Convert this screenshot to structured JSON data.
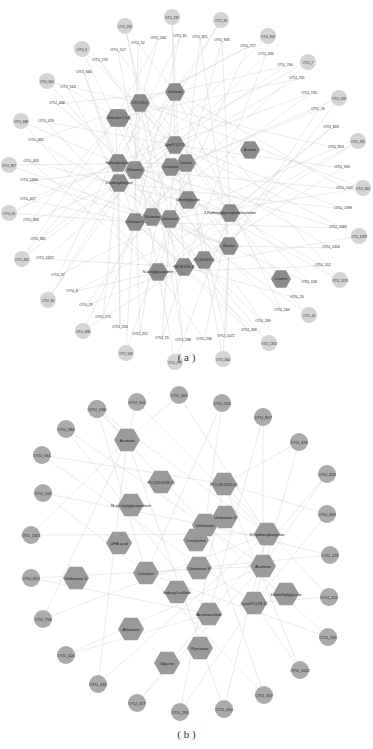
{
  "panel_a": {
    "caption": "( a )",
    "metabolites": [
      {
        "label": "Unknown",
        "x": 175,
        "y": 92
      },
      {
        "label": "LPC(18:0)",
        "x": 140,
        "y": 103
      },
      {
        "label": "PC(18:1/20:4)",
        "x": 120,
        "y": 118
      },
      {
        "label": "Unknown 2",
        "x": 116,
        "y": 118
      },
      {
        "label": "LysoPC(17:1)",
        "x": 175,
        "y": 145
      },
      {
        "label": "Acetone",
        "x": 250,
        "y": 150
      },
      {
        "label": "Hydroxybutyrate",
        "x": 118,
        "y": 163
      },
      {
        "label": "Glutamine",
        "x": 135,
        "y": 170
      },
      {
        "label": "Creatinine",
        "x": 171,
        "y": 167
      },
      {
        "label": "Leucine",
        "x": 186,
        "y": 163
      },
      {
        "label": "3-hydroxybutyrate",
        "x": 119,
        "y": 183
      },
      {
        "label": "Dimethylglycine",
        "x": 188,
        "y": 200
      },
      {
        "label": "1-Palmitoylglycerophosphocholine",
        "x": 230,
        "y": 213
      },
      {
        "label": "Unknown 3",
        "x": 135,
        "y": 222
      },
      {
        "label": "Glutamate",
        "x": 152,
        "y": 217
      },
      {
        "label": "Isoleucine",
        "x": 170,
        "y": 219
      },
      {
        "label": "Betaine",
        "x": 229,
        "y": 246
      },
      {
        "label": "PC(16:0/18:2)",
        "x": 204,
        "y": 260
      },
      {
        "label": "PE(18:0/20:4)",
        "x": 184,
        "y": 267
      },
      {
        "label": "N-acetylglycoprotein",
        "x": 158,
        "y": 272
      },
      {
        "label": "Creatine",
        "x": 281,
        "y": 279
      }
    ],
    "otus_circle": [
      {
        "label": "OTU_233",
        "x": 125,
        "y": 26
      },
      {
        "label": "OTU_237",
        "x": 172,
        "y": 17
      },
      {
        "label": "OTU_90",
        "x": 221,
        "y": 20
      },
      {
        "label": "OTU_903",
        "x": 268,
        "y": 36
      },
      {
        "label": "OTU_7",
        "x": 308,
        "y": 62
      },
      {
        "label": "OTU_539",
        "x": 339,
        "y": 98
      },
      {
        "label": "OTU_705",
        "x": 358,
        "y": 141
      },
      {
        "label": "OTU_360",
        "x": 363,
        "y": 188
      },
      {
        "label": "OTU_1199",
        "x": 359,
        "y": 236
      },
      {
        "label": "OTU_1373",
        "x": 340,
        "y": 280
      },
      {
        "label": "OTU_13",
        "x": 309,
        "y": 315
      },
      {
        "label": "OTU_1353",
        "x": 269,
        "y": 343
      },
      {
        "label": "OTU_306",
        "x": 223,
        "y": 359
      },
      {
        "label": "OTU_377",
        "x": 175,
        "y": 362
      },
      {
        "label": "OTU_549",
        "x": 126,
        "y": 353
      },
      {
        "label": "OTU_498",
        "x": 83,
        "y": 331
      },
      {
        "label": "OTU_30",
        "x": 48,
        "y": 300
      },
      {
        "label": "OTU_355",
        "x": 22,
        "y": 259
      },
      {
        "label": "OTU_50",
        "x": 9,
        "y": 213
      },
      {
        "label": "OTU_367",
        "x": 9,
        "y": 165
      },
      {
        "label": "OTU_448",
        "x": 21,
        "y": 121
      },
      {
        "label": "OTU_600",
        "x": 47,
        "y": 81
      },
      {
        "label": "OTU_6",
        "x": 82,
        "y": 49
      }
    ],
    "otus_text": [
      {
        "label": "OTU_52",
        "x": 138,
        "y": 44
      },
      {
        "label": "OTU_534",
        "x": 158,
        "y": 39
      },
      {
        "label": "OTU_81",
        "x": 180,
        "y": 37
      },
      {
        "label": "OTU_821",
        "x": 200,
        "y": 38
      },
      {
        "label": "OTU_835",
        "x": 222,
        "y": 41
      },
      {
        "label": "OTU_717",
        "x": 248,
        "y": 47
      },
      {
        "label": "OTU_436",
        "x": 266,
        "y": 55
      },
      {
        "label": "OTU_700",
        "x": 285,
        "y": 66
      },
      {
        "label": "OTU_741",
        "x": 297,
        "y": 79
      },
      {
        "label": "OTU_745",
        "x": 309,
        "y": 94
      },
      {
        "label": "OTU_76",
        "x": 318,
        "y": 110
      },
      {
        "label": "OTU_826",
        "x": 331,
        "y": 128
      },
      {
        "label": "OTU_813",
        "x": 336,
        "y": 148
      },
      {
        "label": "OTU_963",
        "x": 342,
        "y": 168
      },
      {
        "label": "OTU_1047",
        "x": 345,
        "y": 189
      },
      {
        "label": "OTU_1398",
        "x": 343,
        "y": 209
      },
      {
        "label": "OTU_1083",
        "x": 338,
        "y": 228
      },
      {
        "label": "OTU_1454",
        "x": 331,
        "y": 248
      },
      {
        "label": "OTU_152",
        "x": 323,
        "y": 266
      },
      {
        "label": "OTU_158",
        "x": 309,
        "y": 283
      },
      {
        "label": "OTU_20",
        "x": 297,
        "y": 298
      },
      {
        "label": "OTU_264",
        "x": 282,
        "y": 311
      },
      {
        "label": "OTU_289",
        "x": 263,
        "y": 322
      },
      {
        "label": "OTU_209",
        "x": 249,
        "y": 331
      },
      {
        "label": "OTU_1072",
        "x": 226,
        "y": 337
      },
      {
        "label": "OTU_236",
        "x": 204,
        "y": 340
      },
      {
        "label": "OTU_238",
        "x": 183,
        "y": 341
      },
      {
        "label": "OTU_25",
        "x": 162,
        "y": 339
      },
      {
        "label": "OTU_251",
        "x": 140,
        "y": 335
      },
      {
        "label": "OTU_256",
        "x": 120,
        "y": 328
      },
      {
        "label": "OTU_273",
        "x": 103,
        "y": 318
      },
      {
        "label": "OTU_29",
        "x": 86,
        "y": 306
      },
      {
        "label": "OTU_3",
        "x": 72,
        "y": 292
      },
      {
        "label": "OTU_37",
        "x": 58,
        "y": 276
      },
      {
        "label": "OTU_1321",
        "x": 45,
        "y": 259
      },
      {
        "label": "OTU_381",
        "x": 38,
        "y": 240
      },
      {
        "label": "OTU_393",
        "x": 31,
        "y": 221
      },
      {
        "label": "OTU_417",
        "x": 28,
        "y": 200
      },
      {
        "label": "OTU_1364",
        "x": 29,
        "y": 181
      },
      {
        "label": "OTU_453",
        "x": 31,
        "y": 162
      },
      {
        "label": "OTU_461",
        "x": 36,
        "y": 141
      },
      {
        "label": "OTU_476",
        "x": 46,
        "y": 122
      },
      {
        "label": "OTU_436b",
        "x": 57,
        "y": 104
      },
      {
        "label": "OTU_513",
        "x": 68,
        "y": 88
      },
      {
        "label": "OTU_666",
        "x": 84,
        "y": 73
      },
      {
        "label": "OTU_176",
        "x": 100,
        "y": 61
      },
      {
        "label": "OTU_517",
        "x": 118,
        "y": 51
      }
    ]
  },
  "panel_b": {
    "caption": "( b )",
    "metabolites": [
      {
        "label": "Acetate",
        "x": 127,
        "y": 440
      },
      {
        "label": "PC(16:0/18:2)",
        "x": 161,
        "y": 482
      },
      {
        "label": "PC(18:0/20:4)",
        "x": 224,
        "y": 484
      },
      {
        "label": "N-acetylglycoprotein",
        "x": 131,
        "y": 505
      },
      {
        "label": "Unknown 4",
        "x": 225,
        "y": 517
      },
      {
        "label": "Unknown",
        "x": 205,
        "y": 525
      },
      {
        "label": "Creatinine",
        "x": 196,
        "y": 540
      },
      {
        "label": "3-hydroxybutyrate",
        "x": 267,
        "y": 534
      },
      {
        "label": "UFA acid",
        "x": 119,
        "y": 543
      },
      {
        "label": "Unknown 3",
        "x": 199,
        "y": 568
      },
      {
        "label": "Acetone",
        "x": 263,
        "y": 566
      },
      {
        "label": "Unknown 1",
        "x": 76,
        "y": 578
      },
      {
        "label": "Creatine",
        "x": 146,
        "y": 573
      },
      {
        "label": "Dimethylglycine",
        "x": 286,
        "y": 594
      },
      {
        "label": "Indoxyl sulfate",
        "x": 177,
        "y": 592
      },
      {
        "label": "LysoPC(18:1)",
        "x": 254,
        "y": 603
      },
      {
        "label": "Allantoin",
        "x": 131,
        "y": 629
      },
      {
        "label": "Acetoacetate",
        "x": 209,
        "y": 614
      },
      {
        "label": "Pyruvate",
        "x": 200,
        "y": 648
      },
      {
        "label": "Glycine",
        "x": 167,
        "y": 663
      }
    ],
    "otus": [
      {
        "label": "OTU_505",
        "x": 137,
        "y": 402
      },
      {
        "label": "OTU_255",
        "x": 222,
        "y": 403
      },
      {
        "label": "OTU_827",
        "x": 263,
        "y": 417
      },
      {
        "label": "OTU_476",
        "x": 299,
        "y": 442
      },
      {
        "label": "OTU_361",
        "x": 179,
        "y": 395
      },
      {
        "label": "OTU_1481",
        "x": 97,
        "y": 409
      },
      {
        "label": "OTU_384",
        "x": 66,
        "y": 429
      },
      {
        "label": "OTU_561",
        "x": 42,
        "y": 455
      },
      {
        "label": "OTU_536",
        "x": 97,
        "y": 409
      },
      {
        "label": "OTU_559",
        "x": 43,
        "y": 493
      },
      {
        "label": "OTU_426",
        "x": 327,
        "y": 474
      },
      {
        "label": "OTU_434",
        "x": 327,
        "y": 514
      },
      {
        "label": "OTU_1321",
        "x": 31,
        "y": 535
      },
      {
        "label": "OTU_225",
        "x": 330,
        "y": 555
      },
      {
        "label": "OTU_655",
        "x": 31,
        "y": 578
      },
      {
        "label": "OTU_220",
        "x": 329,
        "y": 597
      },
      {
        "label": "OTU_756",
        "x": 43,
        "y": 619
      },
      {
        "label": "OTU_335",
        "x": 328,
        "y": 637
      },
      {
        "label": "OTU_420",
        "x": 66,
        "y": 655
      },
      {
        "label": "OTU_1022",
        "x": 300,
        "y": 670
      },
      {
        "label": "OTU_432",
        "x": 98,
        "y": 684
      },
      {
        "label": "OTU_337",
        "x": 264,
        "y": 695
      },
      {
        "label": "OTU_477",
        "x": 137,
        "y": 703
      },
      {
        "label": "OTU_295",
        "x": 180,
        "y": 712
      },
      {
        "label": "OTU_450",
        "x": 224,
        "y": 709
      }
    ]
  },
  "colors": {
    "hex_fill_a": "#8c8c8c",
    "hex_fill_b": "#9a9a9a",
    "otu_fill_a": "#d4d4d4",
    "otu_fill_b": "#aaaaaa",
    "edge": "#cfcfcf"
  }
}
